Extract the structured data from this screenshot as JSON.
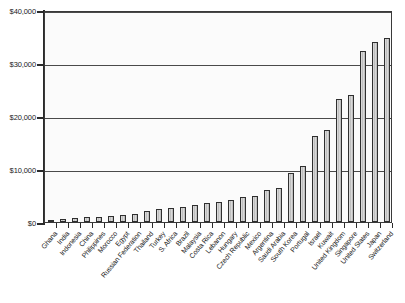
{
  "chart_data": {
    "type": "bar",
    "title": "",
    "xlabel": "",
    "ylabel": "",
    "ylim": [
      0,
      40000
    ],
    "grid": true,
    "legend": "none",
    "y_ticks": [
      "$0",
      "$10,000",
      "$20,000",
      "$30,000",
      "$40,000"
    ],
    "y_tick_values": [
      0,
      10000,
      20000,
      30000,
      40000
    ],
    "categories": [
      "Ghana",
      "India",
      "Indonesia",
      "China",
      "Philippines",
      "Morocco",
      "Egypt",
      "Russian Federation",
      "Thailand",
      "Turkey",
      "S. Africa",
      "Brazil",
      "Malaysia",
      "Costa Rica",
      "Lebanon",
      "Hungary",
      "Czech Republic",
      "Mexico",
      "Argentina",
      "Saudi Arabia",
      "South Korea",
      "Portugal",
      "Israel",
      "Kuwait",
      "United Kingdom",
      "Singapore",
      "United States",
      "Japan",
      "Switzerland"
    ],
    "values": [
      400,
      600,
      700,
      900,
      1000,
      1100,
      1400,
      1500,
      2000,
      2400,
      2700,
      2900,
      3300,
      3500,
      3700,
      4200,
      4700,
      5000,
      6100,
      6400,
      9200,
      10500,
      16200,
      17400,
      23300,
      24000,
      32300,
      34000,
      34700
    ],
    "colors": {
      "bar_fill": "#d0d0d0",
      "bar_outline": "#2f2f2f",
      "axis": "#2b2b2b",
      "gridline": "#4a4a4a",
      "plot_background": "#fbfbfb",
      "page_background": "#ffffff"
    }
  }
}
